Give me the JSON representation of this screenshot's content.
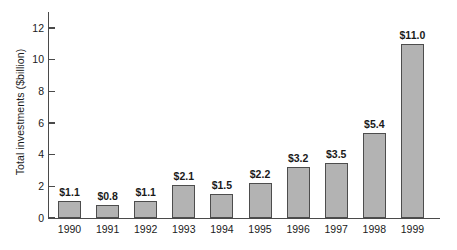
{
  "chart_data": {
    "type": "bar",
    "title": "",
    "subtitle": "",
    "xlabel": "",
    "ylabel": "Total investments ($billion)",
    "categories": [
      "1990",
      "1991",
      "1992",
      "1993",
      "1994",
      "1995",
      "1996",
      "1997",
      "1998",
      "1999"
    ],
    "values": [
      1.1,
      0.8,
      1.1,
      2.1,
      1.5,
      2.2,
      3.2,
      3.5,
      5.4,
      11.0
    ],
    "data_labels": [
      "$1.1",
      "$0.8",
      "$1.1",
      "$2.1",
      "$1.5",
      "$2.2",
      "$3.2",
      "$3.5",
      "$5.4",
      "$11.0"
    ],
    "ylim": [
      0,
      12
    ],
    "yticks": [
      0,
      2,
      4,
      6,
      8,
      10,
      12
    ],
    "ytick_labels": [
      "0",
      "2",
      "4",
      "6",
      "8",
      "10",
      "12"
    ],
    "grid": false,
    "legend": null,
    "legend_position": "none",
    "colors": {
      "bar_fill": "#b3b3b3",
      "bar_border": "#4d4d4d",
      "axis": "#4a4a4a",
      "text": "#1a1a1a",
      "background": "#ffffff"
    }
  }
}
